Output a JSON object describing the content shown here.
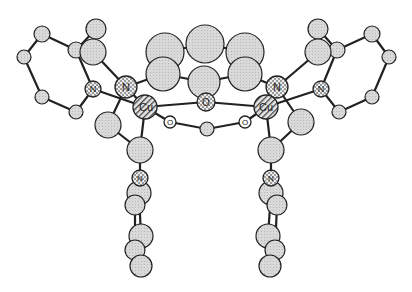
{
  "diagram": {
    "type": "ball-and-stick molecular structure",
    "labels": {
      "n1": "N",
      "n2": "N",
      "n3": "N",
      "n4": "N",
      "n5": "N",
      "n6": "N",
      "cu1": "Cu",
      "cu2": "Cu",
      "o1": "O",
      "o2": "O",
      "o3": "O"
    },
    "atoms": [
      {
        "id": "c1",
        "el": "C",
        "x": 165,
        "y": 52,
        "r": 19
      },
      {
        "id": "c2",
        "el": "C",
        "x": 205,
        "y": 44,
        "r": 19
      },
      {
        "id": "c3",
        "el": "C",
        "x": 245,
        "y": 52,
        "r": 19
      },
      {
        "id": "c4",
        "el": "C",
        "x": 163,
        "y": 74,
        "r": 17
      },
      {
        "id": "c5",
        "el": "C",
        "x": 204,
        "y": 82,
        "r": 16
      },
      {
        "id": "c6",
        "el": "C",
        "x": 245,
        "y": 74,
        "r": 17
      },
      {
        "id": "c7",
        "el": "C",
        "x": 96,
        "y": 29,
        "r": 10
      },
      {
        "id": "c8",
        "el": "C",
        "x": 93,
        "y": 52,
        "r": 13
      },
      {
        "id": "c9",
        "el": "C",
        "x": 76,
        "y": 50,
        "r": 8
      },
      {
        "id": "c10",
        "el": "C",
        "x": 42,
        "y": 34,
        "r": 8
      },
      {
        "id": "c11",
        "el": "C",
        "x": 24,
        "y": 57,
        "r": 7
      },
      {
        "id": "c12",
        "el": "C",
        "x": 42,
        "y": 97,
        "r": 7
      },
      {
        "id": "c13",
        "el": "C",
        "x": 76,
        "y": 112,
        "r": 7
      },
      {
        "id": "c14",
        "el": "C",
        "x": 108,
        "y": 125,
        "r": 13
      },
      {
        "id": "c15",
        "el": "C",
        "x": 140,
        "y": 150,
        "r": 13
      },
      {
        "id": "c16",
        "el": "C",
        "x": 139,
        "y": 193,
        "r": 12
      },
      {
        "id": "c17",
        "el": "C",
        "x": 135,
        "y": 205,
        "r": 10
      },
      {
        "id": "c18",
        "el": "C",
        "x": 141,
        "y": 236,
        "r": 12
      },
      {
        "id": "c19",
        "el": "C",
        "x": 135,
        "y": 250,
        "r": 10
      },
      {
        "id": "c20",
        "el": "C",
        "x": 141,
        "y": 266,
        "r": 11
      },
      {
        "id": "c21",
        "el": "C",
        "x": 318,
        "y": 29,
        "r": 10
      },
      {
        "id": "c22",
        "el": "C",
        "x": 318,
        "y": 52,
        "r": 13
      },
      {
        "id": "c23",
        "el": "C",
        "x": 337,
        "y": 50,
        "r": 8
      },
      {
        "id": "c24",
        "el": "C",
        "x": 372,
        "y": 34,
        "r": 8
      },
      {
        "id": "c25",
        "el": "C",
        "x": 389,
        "y": 57,
        "r": 7
      },
      {
        "id": "c26",
        "el": "C",
        "x": 372,
        "y": 97,
        "r": 7
      },
      {
        "id": "c27",
        "el": "C",
        "x": 339,
        "y": 112,
        "r": 7
      },
      {
        "id": "c28",
        "el": "C",
        "x": 301,
        "y": 122,
        "r": 13
      },
      {
        "id": "c29",
        "el": "C",
        "x": 271,
        "y": 150,
        "r": 13
      },
      {
        "id": "c30",
        "el": "C",
        "x": 271,
        "y": 193,
        "r": 12
      },
      {
        "id": "c31",
        "el": "C",
        "x": 277,
        "y": 205,
        "r": 10
      },
      {
        "id": "c32",
        "el": "C",
        "x": 268,
        "y": 236,
        "r": 12
      },
      {
        "id": "c33",
        "el": "C",
        "x": 275,
        "y": 250,
        "r": 10
      },
      {
        "id": "c34",
        "el": "C",
        "x": 270,
        "y": 266,
        "r": 11
      },
      {
        "id": "n1",
        "el": "N",
        "x": 126,
        "y": 87,
        "r": 11
      },
      {
        "id": "n2",
        "el": "N",
        "x": 93,
        "y": 89,
        "r": 8
      },
      {
        "id": "n3",
        "el": "N",
        "x": 277,
        "y": 87,
        "r": 11
      },
      {
        "id": "n4",
        "el": "N",
        "x": 321,
        "y": 89,
        "r": 8
      },
      {
        "id": "n5",
        "el": "N",
        "x": 140,
        "y": 178,
        "r": 8
      },
      {
        "id": "n6",
        "el": "N",
        "x": 271,
        "y": 178,
        "r": 8
      },
      {
        "id": "cu1",
        "el": "Cu",
        "x": 145,
        "y": 107,
        "r": 12
      },
      {
        "id": "cu2",
        "el": "Cu",
        "x": 266,
        "y": 107,
        "r": 12
      },
      {
        "id": "o1",
        "el": "Oc",
        "x": 206,
        "y": 102,
        "r": 9
      },
      {
        "id": "o2",
        "el": "O",
        "x": 170,
        "y": 122,
        "r": 6
      },
      {
        "id": "o3",
        "el": "O",
        "x": 245,
        "y": 122,
        "r": 6
      },
      {
        "id": "c35",
        "el": "C",
        "x": 207,
        "y": 129,
        "r": 7
      }
    ],
    "bonds": [
      [
        "c1",
        "c2"
      ],
      [
        "c2",
        "c3"
      ],
      [
        "c1",
        "c4"
      ],
      [
        "c3",
        "c6"
      ],
      [
        "c4",
        "c5"
      ],
      [
        "c5",
        "c6"
      ],
      [
        "c4",
        "n1"
      ],
      [
        "c6",
        "n3"
      ],
      [
        "c5",
        "o1"
      ],
      [
        "n1",
        "c8"
      ],
      [
        "c8",
        "c7"
      ],
      [
        "c8",
        "c9"
      ],
      [
        "c7",
        "c9"
      ],
      [
        "c9",
        "c10"
      ],
      [
        "c10",
        "c11"
      ],
      [
        "c11",
        "c12"
      ],
      [
        "c12",
        "c13"
      ],
      [
        "c13",
        "n2"
      ],
      [
        "n2",
        "c9"
      ],
      [
        "n1",
        "cu1"
      ],
      [
        "n2",
        "cu1"
      ],
      [
        "n1",
        "c14"
      ],
      [
        "c14",
        "c15"
      ],
      [
        "cu1",
        "c15"
      ],
      [
        "c15",
        "n5"
      ],
      [
        "n5",
        "c16"
      ],
      [
        "c16",
        "c18"
      ],
      [
        "c17",
        "c19"
      ],
      [
        "c18",
        "c20"
      ],
      [
        "c19",
        "c20"
      ],
      [
        "n3",
        "c22"
      ],
      [
        "c22",
        "c21"
      ],
      [
        "c22",
        "c23"
      ],
      [
        "c21",
        "c23"
      ],
      [
        "c23",
        "c24"
      ],
      [
        "c24",
        "c25"
      ],
      [
        "c25",
        "c26"
      ],
      [
        "c26",
        "c27"
      ],
      [
        "c27",
        "n4"
      ],
      [
        "n4",
        "c23"
      ],
      [
        "n3",
        "cu2"
      ],
      [
        "n4",
        "cu2"
      ],
      [
        "n3",
        "c28"
      ],
      [
        "c28",
        "c29"
      ],
      [
        "cu2",
        "c29"
      ],
      [
        "c29",
        "n6"
      ],
      [
        "n6",
        "c30"
      ],
      [
        "c30",
        "c32"
      ],
      [
        "c31",
        "c33"
      ],
      [
        "c32",
        "c34"
      ],
      [
        "c33",
        "c34"
      ],
      [
        "cu1",
        "o1"
      ],
      [
        "cu2",
        "o1"
      ],
      [
        "cu1",
        "o2"
      ],
      [
        "cu2",
        "o3"
      ],
      [
        "o2",
        "c35"
      ],
      [
        "o3",
        "c35"
      ]
    ]
  }
}
